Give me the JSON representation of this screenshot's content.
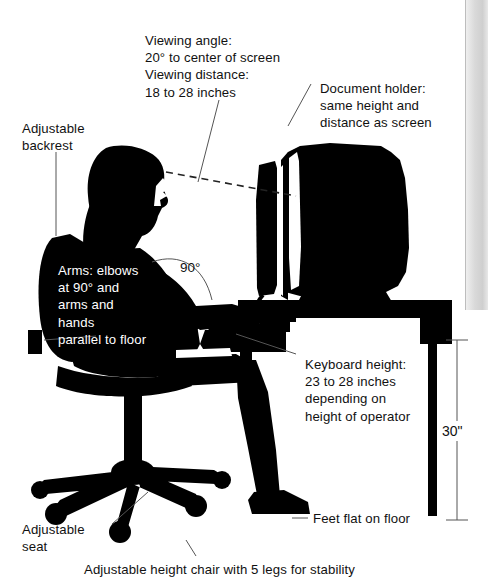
{
  "figure": {
    "caption": "Adjustable height chair with 5 legs for stability"
  },
  "annotations": {
    "viewing": "Viewing angle:\n20° to center of screen\nViewing distance:\n18 to 28 inches",
    "document_holder": "Document holder:\nsame height and\ndistance as screen",
    "backrest": "Adjustable\nbackrest",
    "arms": "Arms: elbows\nat 90° and\narms and\nhands\nparallel to floor",
    "elbow_angle": "90°",
    "keyboard": "Keyboard height:\n23 to 28 inches\ndepending on\nheight of operator",
    "desk_height": "30\"",
    "feet": "Feet flat on floor",
    "seat": "Adjustable\nseat",
    "chair": "Adjustable height chair with 5 legs for stability"
  },
  "colors": {
    "silhouette": "#000000",
    "background": "#ffffff",
    "leader": "#555555",
    "text": "#111111",
    "edge": "#d4d4d4"
  }
}
